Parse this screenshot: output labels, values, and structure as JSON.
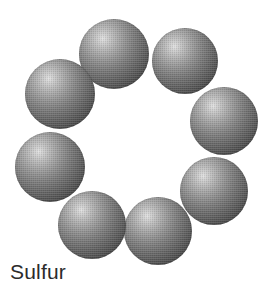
{
  "figure": {
    "title": "Sulfur",
    "caption": "Sulfur",
    "background_color": "#ffffff",
    "width": 271,
    "height": 292
  },
  "molecule": {
    "name": "Sulfur",
    "formula_note": "S8 ring",
    "atom_count": 8,
    "element_symbol": "S",
    "sphere_style": {
      "highlight_color": "#e2e2e2",
      "midtone_color": "#8f8f8f",
      "edge_color": "#252525",
      "highlight_offset": "34% 28%"
    },
    "atoms": [
      {
        "label": "atom-1",
        "cx": 114,
        "cy": 54,
        "r": 35
      },
      {
        "label": "atom-2",
        "cx": 185,
        "cy": 61,
        "r": 33
      },
      {
        "label": "atom-3",
        "cx": 224,
        "cy": 121,
        "r": 34
      },
      {
        "label": "atom-4",
        "cx": 214,
        "cy": 191,
        "r": 34
      },
      {
        "label": "atom-5",
        "cx": 158,
        "cy": 231,
        "r": 34
      },
      {
        "label": "atom-6",
        "cx": 92,
        "cy": 225,
        "r": 34
      },
      {
        "label": "atom-7",
        "cx": 50,
        "cy": 167,
        "r": 35
      },
      {
        "label": "atom-8",
        "cx": 60,
        "cy": 94,
        "r": 35
      }
    ]
  },
  "caption": {
    "text": "Sulfur",
    "color": "#2b2b2b",
    "font_size_px": 21
  }
}
